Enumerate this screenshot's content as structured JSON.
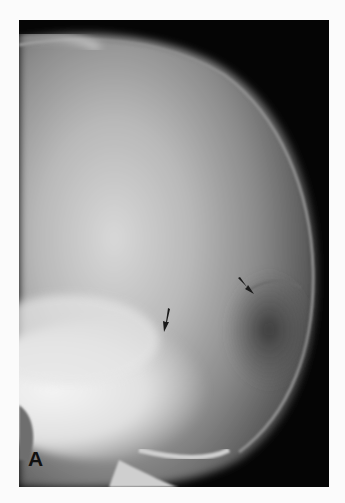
{
  "figure": {
    "panel_label": "A",
    "annotations": [
      {
        "type": "arrow",
        "x": 163,
        "y": 320,
        "direction": "down"
      },
      {
        "type": "arrow",
        "x": 245,
        "y": 288,
        "direction": "down-right"
      }
    ],
    "colors": {
      "background": "#fbfbfb",
      "film": "#050505",
      "label": "#111111"
    }
  }
}
